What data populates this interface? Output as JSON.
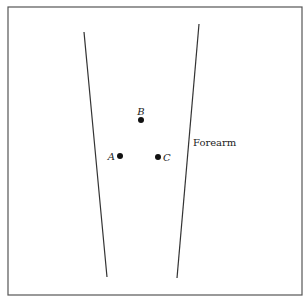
{
  "diagram": {
    "labels": {
      "forearm": "Forearm",
      "point_a": "A",
      "point_b": "B",
      "point_c": "C"
    },
    "colors": {
      "line": "#333333",
      "frame": "#555555",
      "dot": "#111111",
      "background": "#ffffff"
    }
  }
}
